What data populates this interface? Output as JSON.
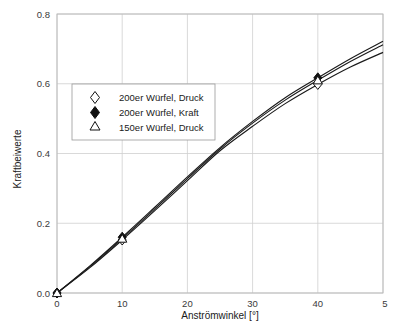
{
  "chart_data": {
    "type": "line",
    "title": "",
    "top_cropped_text": "",
    "xlabel": "Anströmwinkel [°]",
    "ylabel": "Kraftbeiwerte",
    "xlim": [
      0,
      50
    ],
    "ylim": [
      0.0,
      0.8
    ],
    "xticks": [
      0,
      10,
      20,
      30,
      40,
      50
    ],
    "xtick_labels": [
      "0",
      "10",
      "20",
      "30",
      "40",
      "5"
    ],
    "yticks": [
      0.0,
      0.2,
      0.4,
      0.6,
      0.8
    ],
    "ytick_labels": [
      "0.0",
      "0.2",
      "0.4",
      "0.6",
      "0.8"
    ],
    "grid": true,
    "grid_axis": "both",
    "legend_position": "upper-left-inside",
    "x": [
      0,
      5,
      10,
      15,
      20,
      25,
      30,
      35,
      40,
      45,
      50
    ],
    "series": [
      {
        "name": "200er Würfel, Druck",
        "marker": "open-diamond",
        "marker_x": [
          0,
          10,
          40
        ],
        "marker_y": [
          0.0,
          0.152,
          0.598
        ],
        "values": [
          0.0,
          0.072,
          0.152,
          0.236,
          0.322,
          0.408,
          0.478,
          0.543,
          0.598,
          0.648,
          0.69
        ]
      },
      {
        "name": "200er Würfel, Kraft",
        "marker": "filled-diamond",
        "marker_x": [
          0,
          10,
          40
        ],
        "marker_y": [
          0.0,
          0.16,
          0.617
        ],
        "values": [
          0.0,
          0.077,
          0.16,
          0.246,
          0.333,
          0.417,
          0.492,
          0.56,
          0.617,
          0.672,
          0.722
        ]
      },
      {
        "name": "150er Würfel, Druck",
        "marker": "open-triangle",
        "marker_x": [
          0,
          10,
          40
        ],
        "marker_y": [
          0.0,
          0.156,
          0.61
        ],
        "values": [
          0.0,
          0.075,
          0.156,
          0.241,
          0.328,
          0.413,
          0.487,
          0.553,
          0.61,
          0.664,
          0.712
        ]
      }
    ],
    "colors": {
      "curve": "#1a1a1a",
      "grid": "#cfcfcf",
      "frame": "#b8b8b8",
      "background": "#ffffff"
    }
  },
  "legend": {
    "entries": [
      {
        "label": "200er Würfel, Druck",
        "marker": "open-diamond"
      },
      {
        "label": "200er Würfel, Kraft",
        "marker": "filled-diamond"
      },
      {
        "label": "150er Würfel, Druck",
        "marker": "open-triangle"
      }
    ]
  }
}
